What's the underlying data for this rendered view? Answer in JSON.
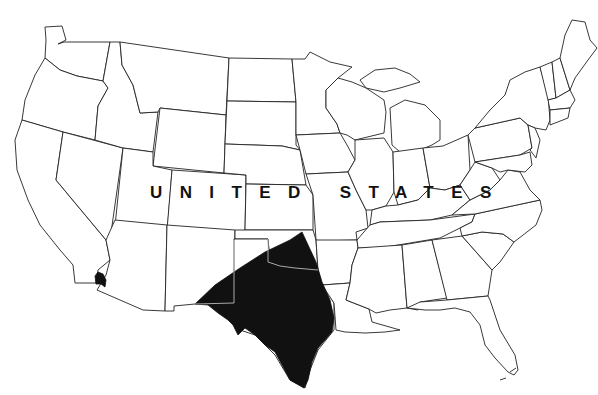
{
  "map": {
    "title": "Distribution range map",
    "country_label_words": [
      "UNITED",
      "STATES"
    ],
    "highlighted_regions": [
      {
        "name": "Texas and adjacent southern plains",
        "color": "#111111"
      },
      {
        "name": "Southern California coastal spot",
        "color": "#111111"
      }
    ],
    "colors": {
      "background": "#ffffff",
      "state_fill": "#ffffff",
      "state_border": "#222222",
      "range_fill": "#111111",
      "range_internal_border": "#cfcfcf"
    }
  }
}
